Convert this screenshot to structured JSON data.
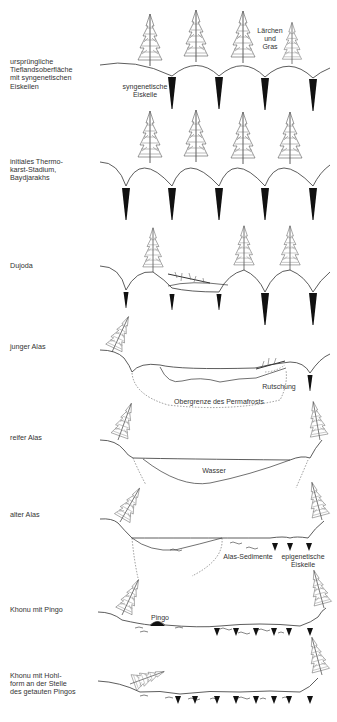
{
  "diagram": {
    "title": "",
    "stages": [
      {
        "id": "stage1",
        "label": "ursprüngliche\nTieflandsoberfläche\nmit syngenetischen\nEiskeilen"
      },
      {
        "id": "stage2",
        "label": "initiales Thermo-\nkarst-Stadium,\nBaydjarakhs"
      },
      {
        "id": "stage3",
        "label": "Dujoda"
      },
      {
        "id": "stage4",
        "label": "junger Alas"
      },
      {
        "id": "stage5",
        "label": "reifer Alas"
      },
      {
        "id": "stage6",
        "label": "alter Alas"
      },
      {
        "id": "stage7",
        "label": "Khonu mit Pingo"
      },
      {
        "id": "stage8",
        "label": "Khonu mit Hohl-\nform an der Stelle\ndes getauten Pingos"
      }
    ],
    "annotations": {
      "larches": "Lärchen\nund\nGras",
      "syngenetic_wedges": "syngenetische\nEiskeile",
      "slump": "Rutschung",
      "permafrost_table": "Obergrenze des Permafrosts",
      "water": "Wasser",
      "alas_sediments": "Alas-Sedimente",
      "epigenetic_wedges": "epigenetische\nEiskeile",
      "pingo": "Pingo"
    }
  }
}
